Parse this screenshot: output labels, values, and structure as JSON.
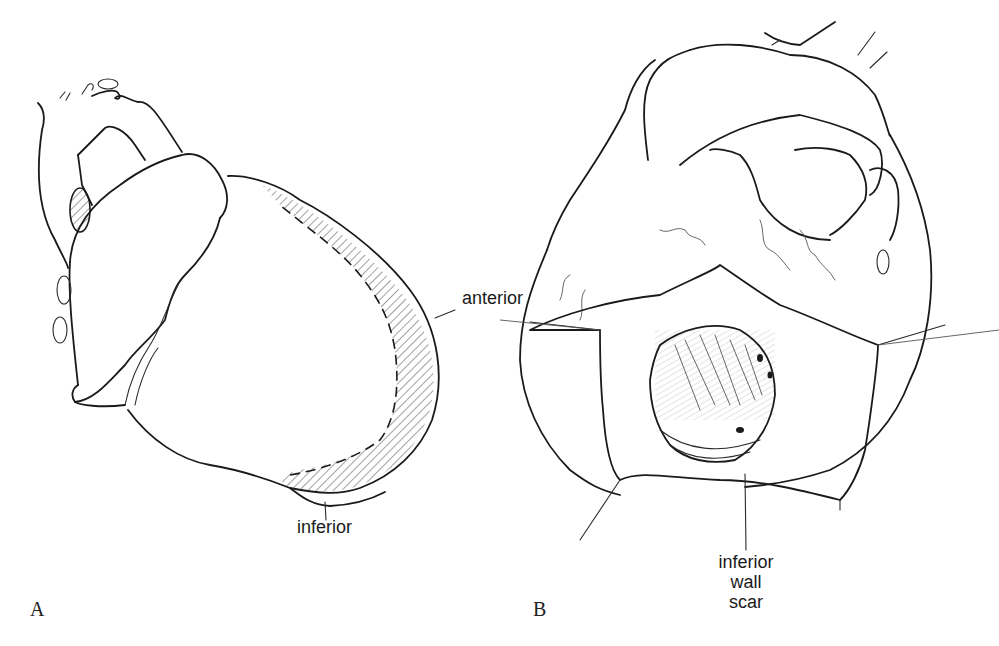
{
  "figure_a": {
    "panel_letter": "A",
    "labels": {
      "anterior": "anterior",
      "inferior": "inferior"
    },
    "description": "Heart exterior with hatched anterior and inferior wall aneurysm region outlined by dashed line"
  },
  "figure_b": {
    "panel_letter": "B",
    "labels": {
      "scar_line1": "inferior",
      "scar_line2": "wall",
      "scar_line3": "scar"
    },
    "description": "Opened ventricle with retracted walls exposing inferior wall scar"
  },
  "colors": {
    "ink": "#1a1a1a",
    "background": "#ffffff"
  }
}
